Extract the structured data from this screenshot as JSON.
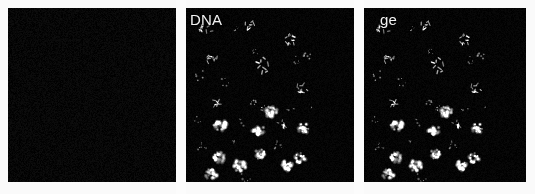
{
  "figure": {
    "kind": "fluorescence-microscopy-panel-series",
    "background_color": "#fbfbfb",
    "panel_background_color": "#050505",
    "label_color": "#f2f2f2",
    "signal_color": "#e8e8e8",
    "panel_count": 3
  },
  "panels": [
    {
      "id": "panel-0",
      "label": "",
      "label_visible": false,
      "channel": "empty-channel",
      "description": "blank dark field, no visible signal",
      "nuclei_visible": 0
    },
    {
      "id": "panel-1",
      "label": "DNA",
      "label_visible": true,
      "channel": "dna-channel",
      "description": "bright stained nuclei on dark field",
      "nuclei_visible": 34
    },
    {
      "id": "panel-2",
      "label": "ge",
      "label_visible": true,
      "channel": "merge-channel",
      "description": "merged channel showing the same nuclei field",
      "nuclei_visible": 34
    }
  ],
  "nuclei_field": {
    "note": "normalized coordinates 0-1 within panel; r is radius fraction of panel width; type: round | mitotic | speckle",
    "items": [
      {
        "x": 0.115,
        "y": 0.132,
        "r": 0.033,
        "type": "mitotic",
        "b": 0.78
      },
      {
        "x": 0.152,
        "y": 0.29,
        "r": 0.029,
        "type": "mitotic",
        "b": 0.72
      },
      {
        "x": 0.09,
        "y": 0.39,
        "r": 0.031,
        "type": "speckle",
        "b": 0.7
      },
      {
        "x": 0.228,
        "y": 0.43,
        "r": 0.026,
        "type": "speckle",
        "b": 0.62
      },
      {
        "x": 0.18,
        "y": 0.545,
        "r": 0.03,
        "type": "mitotic",
        "b": 0.74
      },
      {
        "x": 0.072,
        "y": 0.64,
        "r": 0.022,
        "type": "speckle",
        "b": 0.58
      },
      {
        "x": 0.205,
        "y": 0.672,
        "r": 0.04,
        "type": "round",
        "b": 0.88
      },
      {
        "x": 0.095,
        "y": 0.8,
        "r": 0.026,
        "type": "speckle",
        "b": 0.6
      },
      {
        "x": 0.2,
        "y": 0.855,
        "r": 0.038,
        "type": "round",
        "b": 0.86
      },
      {
        "x": 0.15,
        "y": 0.955,
        "r": 0.036,
        "type": "round",
        "b": 0.82
      },
      {
        "x": 0.318,
        "y": 0.905,
        "r": 0.038,
        "type": "round",
        "b": 0.88
      },
      {
        "x": 0.3,
        "y": 0.12,
        "r": 0.016,
        "type": "speckle",
        "b": 0.66
      },
      {
        "x": 0.372,
        "y": 0.098,
        "r": 0.03,
        "type": "mitotic",
        "b": 0.84
      },
      {
        "x": 0.415,
        "y": 0.245,
        "r": 0.02,
        "type": "speckle",
        "b": 0.58
      },
      {
        "x": 0.46,
        "y": 0.33,
        "r": 0.038,
        "type": "mitotic",
        "b": 0.86
      },
      {
        "x": 0.4,
        "y": 0.54,
        "r": 0.024,
        "type": "speckle",
        "b": 0.64
      },
      {
        "x": 0.455,
        "y": 0.57,
        "r": 0.02,
        "type": "speckle",
        "b": 0.6
      },
      {
        "x": 0.505,
        "y": 0.595,
        "r": 0.036,
        "type": "round",
        "b": 0.84
      },
      {
        "x": 0.33,
        "y": 0.65,
        "r": 0.028,
        "type": "speckle",
        "b": 0.64
      },
      {
        "x": 0.3,
        "y": 0.76,
        "r": 0.022,
        "type": "speckle",
        "b": 0.58
      },
      {
        "x": 0.43,
        "y": 0.7,
        "r": 0.036,
        "type": "round",
        "b": 0.84
      },
      {
        "x": 0.44,
        "y": 0.84,
        "r": 0.034,
        "type": "round",
        "b": 0.8
      },
      {
        "x": 0.355,
        "y": 0.975,
        "r": 0.03,
        "type": "speckle",
        "b": 0.66
      },
      {
        "x": 0.545,
        "y": 0.79,
        "r": 0.026,
        "type": "speckle",
        "b": 0.62
      },
      {
        "x": 0.6,
        "y": 0.905,
        "r": 0.036,
        "type": "round",
        "b": 0.84
      },
      {
        "x": 0.62,
        "y": 0.18,
        "r": 0.03,
        "type": "mitotic",
        "b": 0.78
      },
      {
        "x": 0.66,
        "y": 0.3,
        "r": 0.022,
        "type": "speckle",
        "b": 0.62
      },
      {
        "x": 0.72,
        "y": 0.27,
        "r": 0.026,
        "type": "speckle",
        "b": 0.66
      },
      {
        "x": 0.69,
        "y": 0.46,
        "r": 0.03,
        "type": "mitotic",
        "b": 0.76
      },
      {
        "x": 0.625,
        "y": 0.595,
        "r": 0.026,
        "type": "speckle",
        "b": 0.62
      },
      {
        "x": 0.58,
        "y": 0.665,
        "r": 0.03,
        "type": "mitotic",
        "b": 0.74
      },
      {
        "x": 0.7,
        "y": 0.69,
        "r": 0.034,
        "type": "round",
        "b": 0.82
      },
      {
        "x": 0.745,
        "y": 0.56,
        "r": 0.018,
        "type": "speckle",
        "b": 0.56
      },
      {
        "x": 0.68,
        "y": 0.86,
        "r": 0.034,
        "type": "round",
        "b": 0.82
      }
    ]
  }
}
